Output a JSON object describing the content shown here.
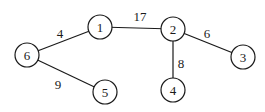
{
  "graph": {
    "nodes": [
      {
        "id": "1",
        "label": "1",
        "x": 100,
        "y": 27
      },
      {
        "id": "2",
        "label": "2",
        "x": 173,
        "y": 29
      },
      {
        "id": "3",
        "label": "3",
        "x": 243,
        "y": 57
      },
      {
        "id": "4",
        "label": "4",
        "x": 173,
        "y": 90
      },
      {
        "id": "5",
        "label": "5",
        "x": 105,
        "y": 92
      },
      {
        "id": "6",
        "label": "6",
        "x": 27,
        "y": 55
      }
    ],
    "edges": [
      {
        "from": "6",
        "to": "1",
        "weight": "4",
        "label_x": 60,
        "label_y": 38
      },
      {
        "from": "1",
        "to": "2",
        "weight": "17",
        "label_x": 140,
        "label_y": 21
      },
      {
        "from": "2",
        "to": "3",
        "weight": "6",
        "label_x": 207,
        "label_y": 38
      },
      {
        "from": "2",
        "to": "4",
        "weight": "8",
        "label_x": 181,
        "label_y": 68
      },
      {
        "from": "6",
        "to": "5",
        "weight": "9",
        "label_x": 58,
        "label_y": 89
      }
    ],
    "node_radius": 12
  }
}
